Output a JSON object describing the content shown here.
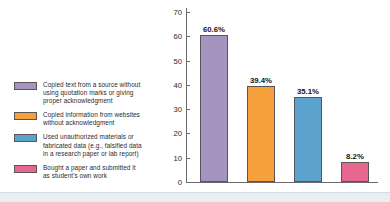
{
  "chart_data": {
    "type": "bar",
    "title": "",
    "xlabel": "",
    "ylabel": "",
    "ylim": [
      0,
      70
    ],
    "yticks": [
      "0",
      "10",
      "20",
      "30",
      "40",
      "50",
      "60",
      "70"
    ],
    "grid": false,
    "legend_position": "left",
    "categories": [
      "Copied text from a source without using quotation marks or giving proper acknowledgment",
      "Copied information from websites without acknowledgment",
      "Used unauthorized materials or fabricated data (e.g., falsified data in a research paper or lab report)",
      "Bought a paper and submitted it as student's own work"
    ],
    "values": [
      60.6,
      39.4,
      35.1,
      8.2
    ],
    "value_labels": [
      "60.6%",
      "39.4%",
      "35.1%",
      "8.2%"
    ],
    "colors": [
      "#a593c0",
      "#f5a03c",
      "#5ba3ce",
      "#e8678f"
    ],
    "bar_outline_color": "#5a5358",
    "axis_color": "#6d6a6d"
  },
  "legend": {
    "items": [
      {
        "label": "Copied text from a source without\nusing quotation marks or giving\nproper acknowledgment",
        "color": "#a593c0"
      },
      {
        "label": "Copied information from websites\nwithout acknowledgment",
        "color": "#f5a03c"
      },
      {
        "label": "Used unauthorized materials or\nfabricated data (e.g., falsified data\nin a research paper or lab report)",
        "color": "#5ba3ce"
      },
      {
        "label": "Bought a paper and submitted it\nas student's own work",
        "color": "#e8678f"
      }
    ]
  }
}
